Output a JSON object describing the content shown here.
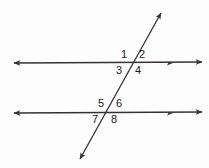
{
  "figure": {
    "type": "geometry-diagram",
    "background_color": "#fdfdfd",
    "stroke_color": "#333333",
    "label_color": "#1b1b1b",
    "width": 209,
    "height": 168
  },
  "lines": [
    {
      "name": "top-parallel-line",
      "orientation": "horizontal",
      "x1": 14,
      "y1": 63,
      "x2": 202,
      "y2": 62,
      "arrow_start": true,
      "arrow_end": true,
      "extra_arrow_at_x": 170
    },
    {
      "name": "bottom-parallel-line",
      "orientation": "horizontal",
      "x1": 14,
      "y1": 113,
      "x2": 202,
      "y2": 112,
      "arrow_start": true,
      "arrow_end": true,
      "extra_arrow_at_x": 170
    },
    {
      "name": "transversal-line",
      "orientation": "oblique",
      "x1": 80,
      "y1": 159,
      "x2": 161,
      "y2": 13,
      "arrow_start": true,
      "arrow_end": true,
      "extra_arrow_at_x": null
    }
  ],
  "intersections": [
    {
      "name": "top-intersection",
      "x": 133,
      "y": 63
    },
    {
      "name": "bottom-intersection",
      "x": 110,
      "y": 112
    }
  ],
  "angle_labels": [
    {
      "id": "1",
      "text": "1",
      "x": 124,
      "y": 55,
      "intersection": "top-intersection",
      "position": "upper-left"
    },
    {
      "id": "2",
      "text": "2",
      "x": 142,
      "y": 55,
      "intersection": "top-intersection",
      "position": "upper-right"
    },
    {
      "id": "3",
      "text": "3",
      "x": 119,
      "y": 71,
      "intersection": "top-intersection",
      "position": "lower-left"
    },
    {
      "id": "4",
      "text": "4",
      "x": 138,
      "y": 71,
      "intersection": "top-intersection",
      "position": "lower-right"
    },
    {
      "id": "5",
      "text": "5",
      "x": 101,
      "y": 104,
      "intersection": "bottom-intersection",
      "position": "upper-left"
    },
    {
      "id": "6",
      "text": "6",
      "x": 119,
      "y": 104,
      "intersection": "bottom-intersection",
      "position": "upper-right"
    },
    {
      "id": "7",
      "text": "7",
      "x": 95,
      "y": 120,
      "intersection": "bottom-intersection",
      "position": "lower-left"
    },
    {
      "id": "8",
      "text": "8",
      "x": 114,
      "y": 120,
      "intersection": "bottom-intersection",
      "position": "lower-right"
    }
  ]
}
